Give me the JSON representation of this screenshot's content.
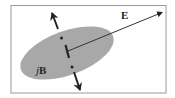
{
  "diagram": {
    "type": "polarization-ellipse",
    "labels": {
      "e_field": "E",
      "b_prefix": "j",
      "b_field": "B"
    },
    "colors": {
      "background": "#ffffff",
      "frame": "#9a9a9a",
      "ellipse_fill": "#a8a8a8",
      "ink": "#222222"
    },
    "elements": [
      {
        "name": "ellipse",
        "description": "gray tilted ellipse"
      },
      {
        "name": "E-vector",
        "description": "arrow from ellipse center to upper right"
      },
      {
        "name": "normal-axis",
        "description": "dotted axis with arrowheads up and down through center"
      },
      {
        "name": "center-marker",
        "description": "short thick bar at center"
      }
    ]
  }
}
